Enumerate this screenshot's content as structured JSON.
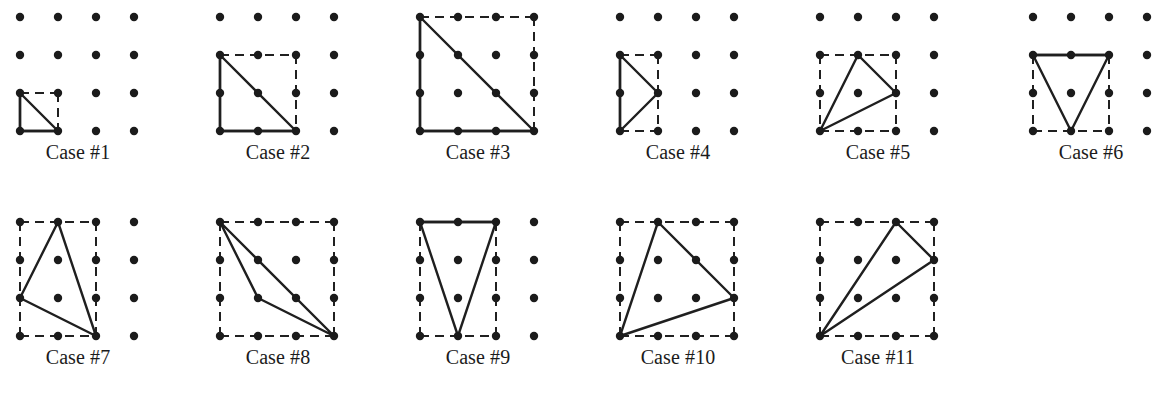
{
  "figure": {
    "title_visible": false,
    "background_color": "#ffffff",
    "dot_color": "#1b1b1b",
    "line_color": "#1f1f1f",
    "dash_color": "#202020",
    "grid": {
      "cols": 4,
      "rows": 4,
      "spacing_px": 38,
      "dot_radius_px": 4.2,
      "solid_stroke_px": 2.4,
      "dash_stroke_px": 2.0,
      "dash_pattern": "9 6"
    },
    "rows": [
      {
        "dot_y": [
          17,
          55,
          93,
          131
        ],
        "label_y": 142
      },
      {
        "dot_y": [
          222,
          260,
          298,
          336
        ],
        "label_y": 347
      }
    ]
  },
  "cases": [
    {
      "label": "Case #1",
      "origin_x": 20,
      "origin_y": 17,
      "label_center_x": 78,
      "label_y": 142,
      "bbox": {
        "x0": 0,
        "y0": 2,
        "x1": 1,
        "y1": 3
      },
      "bbox_solid_edges": [
        "left",
        "bottom"
      ],
      "bbox_dashed_edges": [
        "top",
        "right"
      ],
      "triangle": [
        [
          0,
          2
        ],
        [
          1,
          3
        ],
        [
          0,
          3
        ]
      ],
      "triangle_vertices_labels": [
        "(0,2)",
        "(1,3)",
        "(0,3)"
      ]
    },
    {
      "label": "Case #2",
      "origin_x": 220,
      "origin_y": 17,
      "label_center_x": 278,
      "label_y": 142,
      "bbox": {
        "x0": 0,
        "y0": 1,
        "x1": 2,
        "y1": 3
      },
      "bbox_solid_edges": [
        "left",
        "bottom"
      ],
      "bbox_dashed_edges": [
        "top",
        "right"
      ],
      "triangle": [
        [
          0,
          1
        ],
        [
          2,
          3
        ],
        [
          0,
          3
        ]
      ],
      "triangle_vertices_labels": [
        "(0,1)",
        "(2,3)",
        "(0,3)"
      ]
    },
    {
      "label": "Case #3",
      "origin_x": 420,
      "origin_y": 17,
      "label_center_x": 478,
      "label_y": 142,
      "bbox": {
        "x0": 0,
        "y0": 0,
        "x1": 3,
        "y1": 3
      },
      "bbox_solid_edges": [
        "left",
        "bottom"
      ],
      "bbox_dashed_edges": [
        "top",
        "right"
      ],
      "triangle": [
        [
          0,
          0
        ],
        [
          3,
          3
        ],
        [
          0,
          3
        ]
      ],
      "triangle_vertices_labels": [
        "(0,0)",
        "(3,3)",
        "(0,3)"
      ]
    },
    {
      "label": "Case #4",
      "origin_x": 620,
      "origin_y": 17,
      "label_center_x": 678,
      "label_y": 142,
      "bbox": {
        "x0": 0,
        "y0": 1,
        "x1": 1,
        "y1": 3
      },
      "bbox_solid_edges": [
        "left"
      ],
      "bbox_dashed_edges": [
        "top",
        "right",
        "bottom"
      ],
      "triangle": [
        [
          0,
          1
        ],
        [
          1,
          2
        ],
        [
          0,
          3
        ]
      ],
      "triangle_vertices_labels": [
        "(0,1)",
        "(1,2)",
        "(0,3)"
      ]
    },
    {
      "label": "Case #5",
      "origin_x": 820,
      "origin_y": 17,
      "label_center_x": 878,
      "label_y": 142,
      "bbox": {
        "x0": 0,
        "y0": 1,
        "x1": 2,
        "y1": 3
      },
      "bbox_solid_edges": [],
      "bbox_dashed_edges": [
        "top",
        "right",
        "bottom",
        "left"
      ],
      "triangle": [
        [
          1,
          1
        ],
        [
          2,
          2
        ],
        [
          0,
          3
        ]
      ],
      "triangle_vertices_labels": [
        "(1,1)",
        "(2,2)",
        "(0,3)"
      ]
    },
    {
      "label": "Case #6",
      "origin_x": 1033,
      "origin_y": 17,
      "label_center_x": 1091,
      "label_y": 142,
      "bbox": {
        "x0": 0,
        "y0": 1,
        "x1": 2,
        "y1": 3
      },
      "bbox_solid_edges": [
        "top"
      ],
      "bbox_dashed_edges": [
        "right",
        "bottom",
        "left"
      ],
      "triangle": [
        [
          0,
          1
        ],
        [
          2,
          1
        ],
        [
          1,
          3
        ]
      ],
      "triangle_vertices_labels": [
        "(0,1)",
        "(2,1)",
        "(1,3)"
      ]
    },
    {
      "label": "Case #7",
      "origin_x": 20,
      "origin_y": 222,
      "label_center_x": 78,
      "label_y": 347,
      "bbox": {
        "x0": 0,
        "y0": 0,
        "x1": 2,
        "y1": 3
      },
      "bbox_solid_edges": [],
      "bbox_dashed_edges": [
        "top",
        "right",
        "bottom",
        "left"
      ],
      "triangle": [
        [
          1,
          0
        ],
        [
          0,
          2
        ],
        [
          2,
          3
        ]
      ],
      "triangle_vertices_labels": [
        "(1,0)",
        "(0,2)",
        "(2,3)"
      ]
    },
    {
      "label": "Case #8",
      "origin_x": 220,
      "origin_y": 222,
      "label_center_x": 278,
      "label_y": 347,
      "bbox": {
        "x0": 0,
        "y0": 0,
        "x1": 3,
        "y1": 3
      },
      "bbox_solid_edges": [],
      "bbox_dashed_edges": [
        "top",
        "right",
        "bottom",
        "left"
      ],
      "triangle": [
        [
          0,
          0
        ],
        [
          1,
          2
        ],
        [
          3,
          3
        ]
      ],
      "triangle_vertices_labels": [
        "(0,0)",
        "(1,2)",
        "(3,3)"
      ]
    },
    {
      "label": "Case #9",
      "origin_x": 420,
      "origin_y": 222,
      "label_center_x": 478,
      "label_y": 347,
      "bbox": {
        "x0": 0,
        "y0": 0,
        "x1": 2,
        "y1": 3
      },
      "bbox_solid_edges": [
        "top"
      ],
      "bbox_dashed_edges": [
        "right",
        "bottom",
        "left"
      ],
      "triangle": [
        [
          0,
          0
        ],
        [
          2,
          0
        ],
        [
          1,
          3
        ]
      ],
      "triangle_vertices_labels": [
        "(0,0)",
        "(2,0)",
        "(1,3)"
      ]
    },
    {
      "label": "Case #10",
      "origin_x": 620,
      "origin_y": 222,
      "label_center_x": 678,
      "label_y": 347,
      "bbox": {
        "x0": 0,
        "y0": 0,
        "x1": 3,
        "y1": 3
      },
      "bbox_solid_edges": [],
      "bbox_dashed_edges": [
        "top",
        "right",
        "bottom",
        "left"
      ],
      "triangle": [
        [
          1,
          0
        ],
        [
          3,
          2
        ],
        [
          0,
          3
        ]
      ],
      "triangle_vertices_labels": [
        "(1,0)",
        "(3,2)",
        "(0,3)"
      ]
    },
    {
      "label": "Case #11",
      "origin_x": 820,
      "origin_y": 222,
      "label_center_x": 878,
      "label_y": 347,
      "bbox": {
        "x0": 0,
        "y0": 0,
        "x1": 3,
        "y1": 3
      },
      "bbox_solid_edges": [],
      "bbox_dashed_edges": [
        "top",
        "right",
        "bottom",
        "left"
      ],
      "triangle": [
        [
          2,
          0
        ],
        [
          3,
          1
        ],
        [
          0,
          3
        ]
      ],
      "triangle_vertices_labels": [
        "(2,0)",
        "(3,1)",
        "(0,3)"
      ]
    }
  ]
}
